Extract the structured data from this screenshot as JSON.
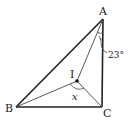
{
  "diagram": {
    "type": "geometry-triangle-incenter",
    "points": {
      "A": {
        "label": "A",
        "x": 103,
        "y": 19
      },
      "B": {
        "label": "B",
        "x": 16,
        "y": 107
      },
      "C": {
        "label": "C",
        "x": 102,
        "y": 107
      },
      "I": {
        "label": "I",
        "x": 77,
        "y": 81
      }
    },
    "angle_A_label": "23°",
    "angle_BIC_label": "x",
    "colors": {
      "stroke": "#222222",
      "thin_stroke": "#444444"
    }
  }
}
